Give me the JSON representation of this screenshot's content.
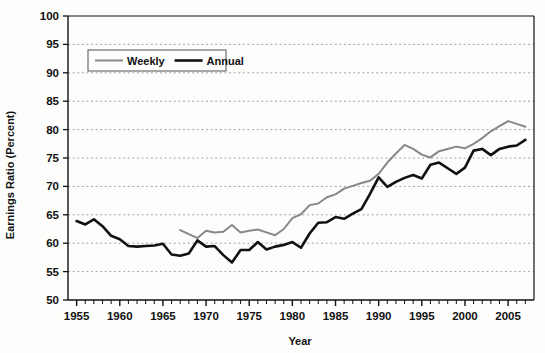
{
  "chart_data": {
    "type": "line",
    "title": "",
    "xlabel": "Year",
    "ylabel": "Earnings Ratio (Percent)",
    "xlim": [
      1954,
      2008
    ],
    "ylim": [
      50,
      100
    ],
    "ytick_step": 5,
    "xtick_step": 5,
    "xtick_minor_step": 1,
    "grid": true,
    "grid_style": "dashed-horizontal",
    "legend_position": "upper-left-inside",
    "yticks": [
      50,
      55,
      60,
      65,
      70,
      75,
      80,
      85,
      90,
      95,
      100
    ],
    "ytick_labels": [
      "50",
      "55",
      "60",
      "65",
      "70",
      "75",
      "80",
      "85",
      "90",
      "95",
      "100"
    ],
    "xticks": [
      1955,
      1960,
      1965,
      1970,
      1975,
      1980,
      1985,
      1990,
      1995,
      2000,
      2005
    ],
    "xtick_labels": [
      "1955",
      "1960",
      "1965",
      "1970",
      "1975",
      "1980",
      "1985",
      "1990",
      "1995",
      "2000",
      "2005"
    ],
    "series": [
      {
        "name": "Weekly",
        "color": "#888888",
        "width": 2.0,
        "x": [
          1967,
          1968,
          1969,
          1970,
          1971,
          1972,
          1973,
          1974,
          1975,
          1976,
          1977,
          1978,
          1979,
          1980,
          1981,
          1982,
          1983,
          1984,
          1985,
          1986,
          1987,
          1988,
          1989,
          1990,
          1991,
          1992,
          1993,
          1994,
          1995,
          1996,
          1997,
          1998,
          1999,
          2000,
          2001,
          2002,
          2003,
          2004,
          2005,
          2006,
          2007
        ],
        "values": [
          62.3,
          61.6,
          60.9,
          62.2,
          61.9,
          62.0,
          63.2,
          61.9,
          62.2,
          62.4,
          61.9,
          61.4,
          62.5,
          64.4,
          65.1,
          66.7,
          67.0,
          68.1,
          68.6,
          69.6,
          70.1,
          70.6,
          71.0,
          72.2,
          74.2,
          75.8,
          77.3,
          76.6,
          75.6,
          75.1,
          76.2,
          76.6,
          77.0,
          76.7,
          77.5,
          78.5,
          79.7,
          80.6,
          81.5,
          81.0,
          80.5
        ]
      },
      {
        "name": "Annual",
        "color": "#111111",
        "width": 2.6,
        "x": [
          1955,
          1956,
          1957,
          1958,
          1959,
          1960,
          1961,
          1962,
          1963,
          1964,
          1965,
          1966,
          1967,
          1968,
          1969,
          1970,
          1971,
          1972,
          1973,
          1974,
          1975,
          1976,
          1977,
          1978,
          1979,
          1980,
          1981,
          1982,
          1983,
          1984,
          1985,
          1986,
          1987,
          1988,
          1989,
          1990,
          1991,
          1992,
          1993,
          1994,
          1995,
          1996,
          1997,
          1998,
          1999,
          2000,
          2001,
          2002,
          2003,
          2004,
          2005,
          2006,
          2007
        ],
        "values": [
          63.9,
          63.3,
          64.2,
          63.0,
          61.3,
          60.7,
          59.5,
          59.4,
          59.5,
          59.6,
          59.9,
          58.0,
          57.8,
          58.2,
          60.5,
          59.4,
          59.5,
          57.9,
          56.6,
          58.8,
          58.8,
          60.2,
          58.9,
          59.4,
          59.7,
          60.2,
          59.2,
          61.7,
          63.6,
          63.7,
          64.6,
          64.3,
          65.2,
          66.0,
          68.7,
          71.6,
          69.9,
          70.8,
          71.5,
          72.0,
          71.4,
          73.8,
          74.2,
          73.2,
          72.2,
          73.3,
          76.3,
          76.6,
          75.5,
          76.6,
          77.0,
          77.2,
          78.2
        ]
      }
    ]
  },
  "legend": {
    "items": [
      {
        "label": "Weekly",
        "color": "#888888"
      },
      {
        "label": "Annual",
        "color": "#111111"
      }
    ]
  }
}
